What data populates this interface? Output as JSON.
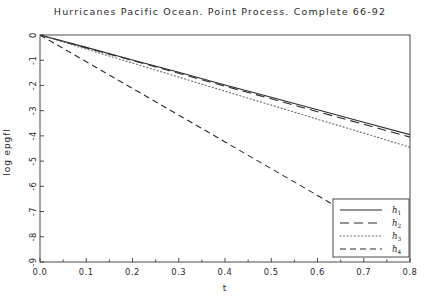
{
  "chart_data": {
    "type": "line",
    "title": "Hurricanes Pacific Ocean. Point Process. Complete 66-92",
    "xlabel": "t",
    "ylabel": "log epgfl",
    "xlim": [
      0.0,
      0.8
    ],
    "ylim": [
      -9,
      0
    ],
    "grid": false,
    "legend_position": "bottom-right",
    "xticks": [
      "0.0",
      "0.1",
      "0.2",
      "0.3",
      "0.4",
      "0.5",
      "0.6",
      "0.7",
      "0.8"
    ],
    "xtick_values": [
      0.0,
      0.1,
      0.2,
      0.3,
      0.4,
      0.5,
      0.6,
      0.7,
      0.8
    ],
    "yticks": [
      "0",
      "-1",
      "-2",
      "-3",
      "-4",
      "-5",
      "-6",
      "-7",
      "-8",
      "-9"
    ],
    "ytick_values": [
      0,
      -1,
      -2,
      -3,
      -4,
      -5,
      -6,
      -7,
      -8,
      -9
    ],
    "x": [
      0.0,
      0.1,
      0.2,
      0.3,
      0.4,
      0.5,
      0.6,
      0.7,
      0.8
    ],
    "series": [
      {
        "name": "h1",
        "label": "h",
        "subscript": "1",
        "style": "solid",
        "color": "#2b2b2b",
        "values": [
          0.0,
          -0.49,
          -0.99,
          -1.48,
          -1.98,
          -2.47,
          -2.96,
          -3.46,
          -3.95
        ]
      },
      {
        "name": "h2",
        "label": "h",
        "subscript": "2",
        "style": "longdash",
        "color": "#2b2b2b",
        "values": [
          0.0,
          -0.51,
          -1.01,
          -1.52,
          -2.03,
          -2.53,
          -3.04,
          -3.54,
          -4.05
        ]
      },
      {
        "name": "h3",
        "label": "h",
        "subscript": "3",
        "style": "dotted",
        "color": "#6d6d6d",
        "values": [
          0.0,
          -0.56,
          -1.11,
          -1.67,
          -2.23,
          -2.78,
          -3.34,
          -3.89,
          -4.45
        ]
      },
      {
        "name": "h4",
        "label": "h",
        "subscript": "4",
        "style": "dashed",
        "color": "#2b2b2b",
        "x_end": 0.66,
        "values": [
          0.0,
          -1.06,
          -2.12,
          -3.18,
          -4.24,
          -5.3,
          -6.36,
          null,
          null
        ],
        "value_at_end": -7.0
      }
    ]
  }
}
